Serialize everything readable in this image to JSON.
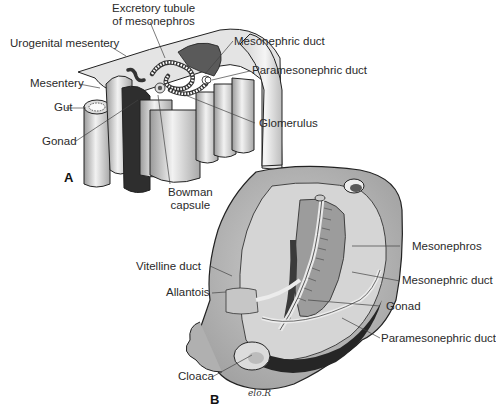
{
  "figure": {
    "panel_a": {
      "label": "A",
      "annotations": {
        "excretory_tubule": "Excretory tubule\nof mesonephros",
        "excretory_tubule_line1": "Excretory tubule",
        "excretory_tubule_line2": "of mesonephros",
        "urogenital_mesentery": "Urogenital mesentery",
        "mesonephric_duct": "Mesonephric duct",
        "paramesonephric_duct": "Paramesonephric duct",
        "mesentery": "Mesentery",
        "gut": "Gut",
        "gonad": "Gonad",
        "glomerulus": "Glomerulus",
        "bowman_line1": "Bowman",
        "bowman_line2": "capsule"
      }
    },
    "panel_b": {
      "label": "B",
      "annotations": {
        "mesonephros": "Mesonephros",
        "vitelline_duct": "Vitelline duct",
        "mesonephric_duct": "Mesonephric duct",
        "allantois": "Allantois",
        "gonad": "Gonad",
        "paramesonephric_duct": "Paramesonephric duct",
        "cloaca": "Cloaca"
      },
      "signature": "elo.R"
    },
    "colors": {
      "tissue_light": "#e6e6e6",
      "tissue_mid": "#b8b8b8",
      "tissue_dark": "#6e6e6e",
      "tissue_black": "#2a2a2a",
      "outline": "#222222",
      "leader_line": "#444444"
    }
  }
}
